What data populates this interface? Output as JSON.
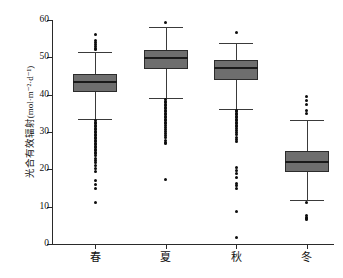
{
  "chart_data": {
    "type": "box",
    "title": "",
    "xlabel": "",
    "ylabel_text": "光合有效辐射",
    "ylabel_unit": "(mol·m⁻²·d⁻¹)",
    "categories": [
      "春",
      "夏",
      "秋",
      "冬"
    ],
    "ylim": [
      0,
      60
    ],
    "yticks": [
      0,
      10,
      20,
      30,
      40,
      50,
      60
    ],
    "ytick_labels": [
      "0",
      "10",
      "20",
      "30",
      "40",
      "50",
      "60"
    ],
    "grid": false,
    "legend": "none",
    "box_fill_color": "#6e6e6e",
    "box_edge_color": "#2b2b2b",
    "median_color": "#1a1a1a",
    "outlier_color": "#0d0d0d",
    "boxes": [
      {
        "category": "春",
        "whisker_low": 33.4,
        "q1": 40.7,
        "median": 43.4,
        "q3": 45.5,
        "whisker_high": 51.5,
        "outliers_high": [
          56.2,
          54.5,
          53.9,
          53.4,
          52.9,
          52.5,
          52.2
        ],
        "outliers_low": [
          33.0,
          32.6,
          32.2,
          31.8,
          31.4,
          31.0,
          30.6,
          30.2,
          29.8,
          29.4,
          29.0,
          28.6,
          28.2,
          27.8,
          27.4,
          27.0,
          26.6,
          26.2,
          25.8,
          25.4,
          25.0,
          24.6,
          24.2,
          23.6,
          23.0,
          22.4,
          21.8,
          21.0,
          20.2,
          19.4,
          17.0,
          16.0,
          15.0,
          11.2
        ]
      },
      {
        "category": "夏",
        "whisker_low": 39.0,
        "q1": 46.9,
        "median": 49.8,
        "q3": 51.9,
        "whisker_high": 58.2,
        "outliers_high": [
          59.3
        ],
        "outliers_low": [
          38.6,
          38.2,
          37.8,
          37.4,
          37.0,
          36.6,
          36.2,
          35.8,
          35.4,
          35.0,
          34.6,
          34.2,
          33.8,
          33.4,
          33.0,
          32.6,
          32.2,
          31.7,
          31.2,
          30.7,
          30.2,
          29.6,
          29.0,
          28.4,
          27.8,
          27.2,
          26.8,
          17.3
        ]
      },
      {
        "category": "秋",
        "whisker_low": 36.2,
        "q1": 44.0,
        "median": 47.2,
        "q3": 49.3,
        "whisker_high": 53.8,
        "outliers_high": [
          56.7
        ],
        "outliers_low": [
          35.8,
          35.4,
          35.0,
          34.6,
          34.2,
          33.8,
          33.4,
          33.0,
          32.6,
          32.2,
          31.8,
          31.4,
          31.0,
          30.5,
          30.0,
          29.2,
          28.6,
          28.0,
          27.5,
          20.5,
          19.8,
          19.0,
          17.9,
          16.3,
          15.6,
          15.0,
          8.8,
          1.7
        ]
      },
      {
        "category": "冬",
        "whisker_low": 11.7,
        "q1": 19.3,
        "median": 22.0,
        "q3": 24.9,
        "whisker_high": 33.2,
        "outliers_high": [
          39.5,
          38.4,
          37.3,
          35.8,
          35.0
        ],
        "outliers_low": [
          11.0,
          7.6,
          7.2,
          6.8,
          6.5
        ]
      }
    ]
  }
}
